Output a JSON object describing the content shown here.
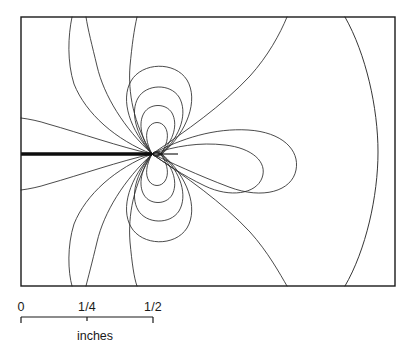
{
  "figure": {
    "title": ""
  },
  "chart_data": {
    "type": "line",
    "title": "",
    "subtitle": "",
    "xlabel": "inches",
    "ylabel": "",
    "grid": false,
    "legend_position": "none",
    "plot_frame": {
      "x0": 21,
      "y0": 17,
      "x1": 395,
      "y1": 286
    },
    "singularity": {
      "label": "crack-tip",
      "x": 152,
      "y": 154
    },
    "crack": {
      "label": "crack-slot",
      "from_x": 21,
      "to_x": 152,
      "y": 154,
      "thickness_px": 3.4
    },
    "scale_bar": {
      "x_start": 21,
      "x_end": 153,
      "y": 317,
      "ticks": [
        {
          "label": "0",
          "x": 21
        },
        {
          "label": "1/4",
          "x": 87
        },
        {
          "label": "1/2",
          "x": 153
        }
      ],
      "units_label": "inches",
      "units_label_x": 95,
      "units_label_y": 340
    },
    "contour_count": 18,
    "contours": [
      {
        "name": "upper-lobe-1",
        "d": "M152,154 C146,143 145,133 149,127 C153,121 161,121 165,127 C169,133 168,143 162,152 C159,155 155,157 152,154 Z"
      },
      {
        "name": "upper-lobe-2",
        "d": "M152,154 C141,139 138,123 144,113 C150,103 166,103 172,113 C178,124 174,140 161,153 C158,156 155,157 152,154 Z"
      },
      {
        "name": "upper-lobe-3",
        "d": "M152,154 C136,135 130,112 138,98 C146,84 170,83 179,97 C188,112 181,136 162,153 C158,157 155,157 152,154 Z"
      },
      {
        "name": "upper-lobe-4",
        "d": "M152,154 C130,130 120,100 131,81 C142,62 175,61 187,80 C199,100 187,132 163,153 C158,158 155,157 152,154 Z"
      },
      {
        "name": "upper-sweep-1",
        "d": "M152,154 C124,128 104,96 97,66 C92,45 88,30 86,17"
      },
      {
        "name": "upper-sweep-2",
        "d": "M152,154 C133,123 128,92 130,66 C132,45 134,30 137,17"
      },
      {
        "name": "upper-left-sweep",
        "d": "M152,154 C116,140 86,114 74,84 C67,62 68,36 72,17"
      },
      {
        "name": "left-ray-upper",
        "d": "M152,154 C120,147 80,133 48,124 C39,121 29,119 21,118"
      },
      {
        "name": "right-teardrop-small",
        "d": "M152,154 C175,146 200,142 225,145 C252,148 268,162 262,178 C256,194 230,198 205,186 C182,175 165,163 152,154 Z"
      },
      {
        "name": "right-teardrop-large",
        "d": "M152,154 C182,138 215,128 248,130 C282,132 300,150 296,170 C292,191 263,200 229,187 C197,175 170,162 152,154 Z"
      },
      {
        "name": "right-upper-sweep",
        "d": "M152,154 C186,131 222,106 250,76 C268,56 280,34 287,17"
      },
      {
        "name": "right-lower-sweep",
        "d": "M152,154 C186,177 222,202 250,232 C268,252 280,274 287,286"
      },
      {
        "name": "outer-right-contour",
        "d": "M345,17 C366,54 378,108 378,152 C378,196 366,250 345,286"
      },
      {
        "name": "lower-lobe-1",
        "d": "M152,154 C146,165 145,175 149,181 C153,187 161,187 165,181 C169,175 168,165 162,156 C159,153 155,151 152,154 Z"
      },
      {
        "name": "lower-lobe-2",
        "d": "M152,154 C141,169 138,185 144,195 C150,205 166,205 172,195 C178,184 174,168 161,155 C158,152 155,151 152,154 Z"
      },
      {
        "name": "lower-lobe-3",
        "d": "M152,154 C136,173 130,196 138,210 C146,224 170,225 179,211 C188,196 181,172 162,155 C158,151 155,151 152,154 Z"
      },
      {
        "name": "lower-lobe-4",
        "d": "M152,154 C130,178 120,208 131,227 C142,246 175,247 187,228 C199,208 187,176 163,155 C158,150 155,151 152,154 Z"
      },
      {
        "name": "lower-sweep-1",
        "d": "M152,154 C124,180 104,212 97,242 C92,263 88,278 86,286"
      },
      {
        "name": "lower-sweep-2",
        "d": "M152,154 C133,185 128,216 130,242 C132,263 134,278 137,286"
      },
      {
        "name": "lower-left-sweep",
        "d": "M152,154 C116,168 86,194 74,224 C67,246 68,272 72,286"
      },
      {
        "name": "left-ray-lower",
        "d": "M152,154 C120,161 80,175 48,184 C39,187 29,189 21,190"
      }
    ],
    "tip_spikes": [
      {
        "name": "tip-spike-right",
        "x1": 152,
        "y1": 154,
        "x2": 178,
        "y2": 154
      }
    ]
  },
  "colors": {
    "background": "#ffffff",
    "frame": "#1a1a1a",
    "contour": "#2b2b2b",
    "crack": "#0d0d0d",
    "text": "#1a1a1a"
  }
}
